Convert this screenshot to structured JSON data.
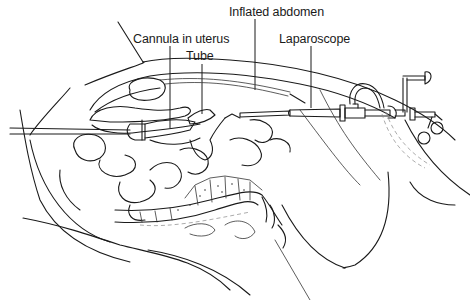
{
  "figure": {
    "labels": [
      {
        "id": "inflated-abdomen",
        "text": "Inflated abdomen"
      },
      {
        "id": "cannula-in-uterus",
        "text": "Cannula in uterus"
      },
      {
        "id": "tube",
        "text": "Tube"
      },
      {
        "id": "laparoscope",
        "text": "Laparoscope"
      }
    ]
  }
}
